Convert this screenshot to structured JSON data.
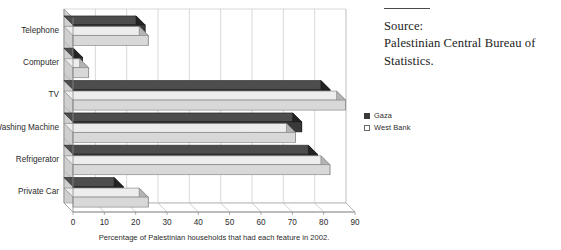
{
  "chart_data": {
    "type": "bar",
    "orientation": "horizontal",
    "title": "",
    "xlabel": "Percentage of Palestinian households that had each feature in 2002.",
    "ylabel": "",
    "xlim": [
      0,
      90
    ],
    "xticks": [
      0,
      10,
      20,
      30,
      40,
      50,
      60,
      70,
      80,
      90
    ],
    "xtick_labels": [
      "0",
      "10",
      "20",
      "30",
      "40",
      "50",
      "60",
      "70",
      "80",
      "90"
    ],
    "grid": true,
    "grid_axis": "x",
    "legend_position": "right",
    "categories": [
      "Telephone",
      "Computer",
      "TV",
      "Washing Machine",
      "Refrigerator",
      "Private Car"
    ],
    "series": [
      {
        "name": "Gaza",
        "color": "#3a3a3a",
        "values": [
          23,
          3,
          82,
          73,
          78,
          16
        ]
      },
      {
        "name": "West Bank",
        "color": "#d8d8d8",
        "values": [
          24,
          5,
          87,
          71,
          82,
          24
        ]
      }
    ]
  },
  "legend": {
    "items": [
      {
        "label": "Gaza",
        "swatch": "filled-dark-square"
      },
      {
        "label": "West Bank",
        "swatch": "open-light-square"
      }
    ]
  },
  "source": {
    "lines": [
      "Source:",
      "Palestinian Central Bureau of",
      "Statistics."
    ]
  },
  "colors": {
    "gaza": "#3a3a3a",
    "west_bank": "#d8d8d8",
    "gaza_side": "#232323",
    "west_bank_side": "#b4b4b4",
    "axis": "#8a8a8a",
    "grid": "#c9c9c9",
    "wall": "#cfcfcf",
    "text": "#2b2b2b"
  }
}
